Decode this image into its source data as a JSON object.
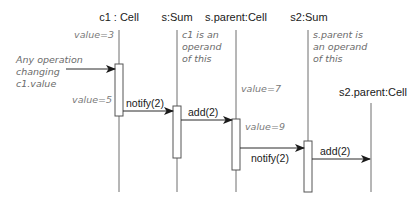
{
  "diagram": {
    "type": "sequence",
    "colors": {
      "line": "#6f6f6f",
      "text": "#1a1a1a",
      "note": "#6b6b6b",
      "arrow": "#2a2a2a"
    },
    "participants": [
      {
        "id": "c1",
        "label": "c1 : Cell"
      },
      {
        "id": "s",
        "label": "s:Sum"
      },
      {
        "id": "sparent",
        "label": "s.parent:Cell"
      },
      {
        "id": "s2",
        "label": "s2:Sum"
      },
      {
        "id": "s2parent",
        "label": "s2.parent:Cell"
      }
    ],
    "messages": [
      {
        "from": "external",
        "to": "c1",
        "label": ""
      },
      {
        "from": "c1",
        "to": "s",
        "label": "notify(2)"
      },
      {
        "from": "s",
        "to": "sparent",
        "label": "add(2)"
      },
      {
        "from": "sparent",
        "to": "s2",
        "label": "notify(2)"
      },
      {
        "from": "s2",
        "to": "s2parent",
        "label": "add(2)"
      }
    ],
    "annotations": {
      "trigger": [
        "Any operation",
        "changing",
        "c1.value"
      ],
      "c1_value_before": "value=3",
      "c1_value_after": "value=5",
      "sparent_value_before": "value=7",
      "sparent_value_after": "value=9",
      "s_note": [
        "c1 is an",
        "operand",
        "of this"
      ],
      "s2_note": [
        "s.parent is",
        "an operand",
        "of this"
      ]
    }
  }
}
